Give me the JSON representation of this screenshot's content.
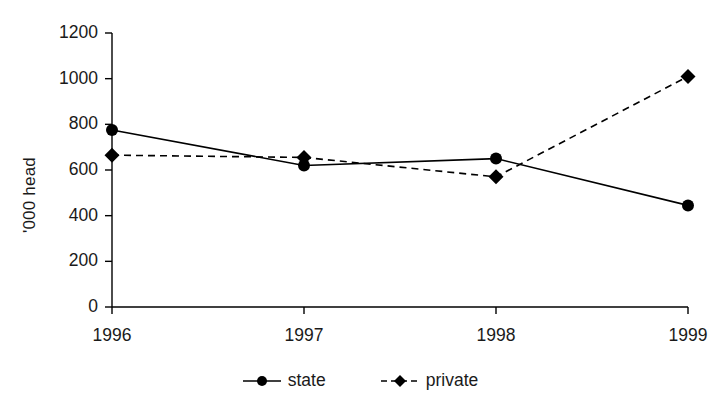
{
  "chart_data": {
    "type": "line",
    "title": "",
    "xlabel": "",
    "ylabel": "'000 head",
    "categories": [
      "1996",
      "1997",
      "1998",
      "1999"
    ],
    "ylim": [
      0,
      1200
    ],
    "yticks": [
      0,
      200,
      400,
      600,
      800,
      1000,
      1200
    ],
    "ytick_labels": [
      "0",
      "200",
      "400",
      "600",
      "800",
      "1000",
      "1200"
    ],
    "grid": false,
    "legend_position": "bottom",
    "series": [
      {
        "name": "state",
        "values": [
          775,
          620,
          650,
          445
        ],
        "line_style": "solid",
        "marker": "circle",
        "color": "#000000"
      },
      {
        "name": "private",
        "values": [
          665,
          655,
          570,
          1010
        ],
        "line_style": "dashed",
        "marker": "diamond",
        "color": "#000000"
      }
    ]
  },
  "legend": {
    "items": [
      {
        "label": "state",
        "marker": "circle-marker",
        "line": "solid-line"
      },
      {
        "label": "private",
        "marker": "diamond-marker",
        "line": "dashed-line"
      }
    ]
  },
  "axes": {
    "y_title": "'000 head",
    "y_labels": [
      "1200",
      "1000",
      "800",
      "600",
      "400",
      "200",
      "0"
    ],
    "x_labels": [
      "1996",
      "1997",
      "1998",
      "1999"
    ]
  },
  "colors": {
    "ink": "#1a1a1a",
    "line": "#000000",
    "background": "#ffffff"
  }
}
